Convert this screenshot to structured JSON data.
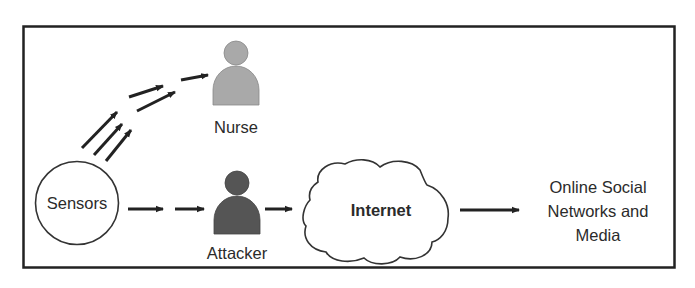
{
  "diagram": {
    "type": "attack-flow",
    "nodes": {
      "sensors": {
        "label": "Sensors",
        "shape": "circle"
      },
      "nurse": {
        "label": "Nurse",
        "shape": "person-icon",
        "color": "#a9a9a9"
      },
      "attacker": {
        "label": "Attacker",
        "shape": "person-icon",
        "color": "#555555"
      },
      "internet": {
        "label": "Internet",
        "shape": "cloud"
      },
      "osn": {
        "label_lines": [
          "Online Social",
          "Networks and",
          "Media"
        ]
      }
    },
    "edges": [
      {
        "from": "sensors",
        "to": "nurse",
        "style": "multiple dashed arrows"
      },
      {
        "from": "sensors",
        "to": "attacker",
        "style": "dashed arrows"
      },
      {
        "from": "attacker",
        "to": "internet",
        "style": "arrow"
      },
      {
        "from": "internet",
        "to": "osn",
        "style": "arrow"
      }
    ],
    "colors": {
      "stroke": "#222222",
      "nurse_fill": "#a9a9a9",
      "attacker_fill": "#555555",
      "background": "#ffffff"
    }
  }
}
